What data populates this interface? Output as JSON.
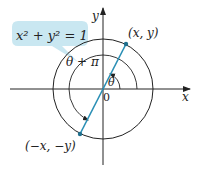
{
  "diagram": {
    "equation_callout": "x² + y² = 1",
    "axis_labels": {
      "x": "x",
      "y": "y"
    },
    "origin_label": "0",
    "point_a_label": "(x, y)",
    "point_b_label": "(−x, −y)",
    "angle_theta_label": "θ",
    "angle_theta_pi_label": "θ + π",
    "colors": {
      "line": "#222222",
      "accent": "#2a8fb5",
      "callout_fill": "#bfe3ee"
    }
  }
}
